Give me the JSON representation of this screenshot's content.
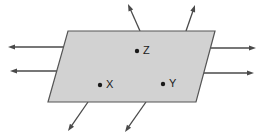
{
  "figure": {
    "background_color": "#ffffff",
    "plane": {
      "name": "charged-plane",
      "fill_color": "#d2d2d2",
      "stroke_color": "#555555",
      "stroke_width": 1.2,
      "vertices": [
        {
          "x": 68,
          "y": 31
        },
        {
          "x": 215,
          "y": 31
        },
        {
          "x": 196,
          "y": 102
        },
        {
          "x": 48,
          "y": 102
        }
      ]
    },
    "points": [
      {
        "id": "point-z",
        "label": "Z",
        "dot": {
          "x": 137,
          "y": 51,
          "r": 2.2
        },
        "text": {
          "x": 143,
          "y": 51
        },
        "color": "#1a1a1a"
      },
      {
        "id": "point-x",
        "label": "X",
        "dot": {
          "x": 100,
          "y": 85,
          "r": 2.2
        },
        "text": {
          "x": 106,
          "y": 85
        },
        "color": "#1a1a1a"
      },
      {
        "id": "point-y",
        "label": "Y",
        "dot": {
          "x": 163,
          "y": 84,
          "r": 2.2
        },
        "text": {
          "x": 169,
          "y": 84
        },
        "color": "#1a1a1a"
      }
    ],
    "field_lines": {
      "stroke_color": "#4a4a4a",
      "stroke_width": 1.3,
      "head_length": 7,
      "head_width": 5,
      "arrows": [
        {
          "id": "field-arrow-left-upper",
          "direction": "left",
          "tail": {
            "x": 66,
            "y": 47
          },
          "tip": {
            "x": 8,
            "y": 47
          }
        },
        {
          "id": "field-arrow-left-lower",
          "direction": "left",
          "tail": {
            "x": 58,
            "y": 71
          },
          "tip": {
            "x": 10,
            "y": 71
          }
        },
        {
          "id": "field-arrow-right-upper",
          "direction": "right",
          "tail": {
            "x": 211,
            "y": 48
          },
          "tip": {
            "x": 256,
            "y": 48
          }
        },
        {
          "id": "field-arrow-right-lower",
          "direction": "right",
          "tail": {
            "x": 203,
            "y": 73
          },
          "tip": {
            "x": 254,
            "y": 73
          }
        },
        {
          "id": "field-arrow-top-left",
          "direction": "up-right",
          "tail": {
            "x": 140,
            "y": 31
          },
          "tip": {
            "x": 128,
            "y": 4
          }
        },
        {
          "id": "field-arrow-top-right",
          "direction": "up-right",
          "tail": {
            "x": 186,
            "y": 31
          },
          "tip": {
            "x": 195,
            "y": 5
          }
        },
        {
          "id": "field-arrow-bottom-left",
          "direction": "down-left",
          "tail": {
            "x": 88,
            "y": 102
          },
          "tip": {
            "x": 68,
            "y": 131
          }
        },
        {
          "id": "field-arrow-bottom-right",
          "direction": "down-left",
          "tail": {
            "x": 146,
            "y": 102
          },
          "tip": {
            "x": 125,
            "y": 132
          }
        }
      ]
    }
  }
}
